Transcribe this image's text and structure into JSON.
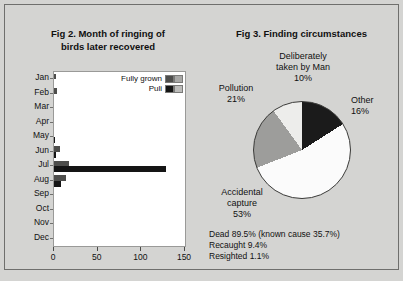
{
  "figure2": {
    "title_line1": "Fig 2. Month of ringing of",
    "title_line2": "birds later recovered",
    "legend": [
      {
        "label": "Fully grown",
        "color_dark": "#4e4e4c",
        "color_light": "#a8a8a6"
      },
      {
        "label": "Puli",
        "color_dark": "#151515",
        "color_light": "#bcbcba"
      }
    ],
    "chart_data": {
      "type": "bar",
      "orientation": "horizontal",
      "title": "Fig 2. Month of ringing of birds later recovered",
      "xlabel": "",
      "ylabel": "",
      "categories": [
        "Jan",
        "Feb",
        "Mar",
        "Apr",
        "May",
        "Jun",
        "Jul",
        "Aug",
        "Sep",
        "Oct",
        "Nov",
        "Dec"
      ],
      "xlim": [
        0,
        150
      ],
      "xticks": [
        0,
        50,
        100,
        150
      ],
      "xtick_labels": [
        "0",
        "50",
        "100",
        "150"
      ],
      "grid": false,
      "legend_position": "top-right",
      "series": [
        {
          "name": "Fully grown",
          "values": [
            2,
            3,
            0,
            0,
            0,
            7,
            17,
            14,
            0,
            0,
            0,
            0
          ]
        },
        {
          "name": "Puli",
          "values": [
            0,
            0,
            0,
            0,
            1,
            2,
            128,
            8,
            0,
            0,
            0,
            0
          ]
        }
      ]
    }
  },
  "figure3": {
    "title": "Fig 3. Finding circumstances",
    "chart_data": {
      "type": "pie",
      "title": "Fig 3. Finding circumstances",
      "labels": [
        "Other",
        "Accidental capture",
        "Pollution",
        "Deliberately taken by Man"
      ],
      "values": [
        16,
        53,
        21,
        10
      ],
      "value_suffix": "%",
      "colors": [
        "#1b1b1b",
        "#fbfbfb",
        "#9d9d9b",
        "#ededeb"
      ],
      "legend_position": "callout-labels"
    },
    "labels": {
      "taken_line1": "Deliberately",
      "taken_line2": "taken by Man",
      "taken_value": "10%",
      "other_line1": "Other",
      "other_value": "16%",
      "pollution_line1": "Pollution",
      "pollution_value": "21%",
      "accidental_line1": "Accidental",
      "accidental_line2": "capture",
      "accidental_value": "53%"
    },
    "footnote": {
      "line1": "Dead 89.5% (known cause 35.7%)",
      "line2": "Recaught 9.4%",
      "line3": "Resighted 1.1%"
    }
  }
}
